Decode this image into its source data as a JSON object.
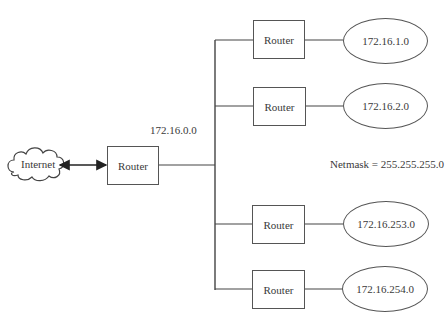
{
  "diagram": {
    "internet": {
      "label": "Internet",
      "icon": "cloud-icon"
    },
    "main_router": {
      "label": "Router"
    },
    "backbone_network": {
      "label": "172.16.0.0"
    },
    "netmask": {
      "label": "Netmask = 255.255.255.0"
    },
    "subnets": [
      {
        "router_label": "Router",
        "network": "172.16.1.0"
      },
      {
        "router_label": "Router",
        "network": "172.16.2.0"
      },
      {
        "router_label": "Router",
        "network": "172.16.253.0"
      },
      {
        "router_label": "Router",
        "network": "172.16.254.0"
      }
    ],
    "colors": {
      "line": "#444444",
      "text": "#3a3a3a",
      "background": "#ffffff"
    }
  }
}
